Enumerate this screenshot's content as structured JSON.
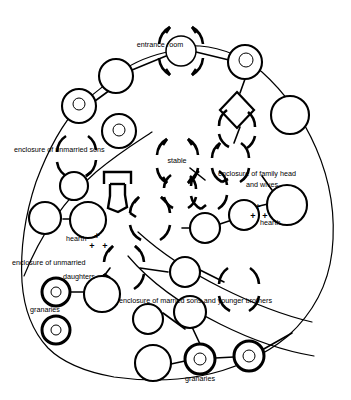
{
  "figure": {
    "type": "architectural-plan-diagram",
    "background_color": "#ffffff",
    "ink_color": "#000000"
  },
  "labels": {
    "entrance_room": "entrance room",
    "enclosure_unmarried_sons": "enclosure of unmarried sons",
    "stable": "stable",
    "enclosure_family_head": "enclosure of family head",
    "enclosure_family_head_2": "and wives",
    "hearth_right": "hearth",
    "hearth_left": "hearth",
    "enclosure_unmarried_daughters_1": "enclosure of unmarried",
    "enclosure_unmarried_daughters_2": "daughters",
    "granaries_left": "granaries",
    "enclosure_married_sons": "enclosure of married sons and younger brothers",
    "granaries_bottom": "granaries"
  },
  "hearth_marks": {
    "left": "+ + +",
    "right": "+ + +"
  },
  "structures": {
    "plain_huts": [
      {
        "id": "hut-top-left",
        "cx": 116,
        "cy": 76,
        "r": 17
      },
      {
        "id": "hut-ul-a",
        "cx": 74,
        "cy": 186,
        "r": 14
      },
      {
        "id": "hut-ul-b",
        "cx": 45,
        "cy": 218,
        "r": 16
      },
      {
        "id": "hut-ul-c",
        "cx": 88,
        "cy": 220,
        "r": 18
      },
      {
        "id": "hut-right-a",
        "cx": 290,
        "cy": 115,
        "r": 19
      },
      {
        "id": "hut-right-b",
        "cx": 287,
        "cy": 205,
        "r": 20
      },
      {
        "id": "hut-mid-a",
        "cx": 205,
        "cy": 228,
        "r": 15
      },
      {
        "id": "hut-mid-b",
        "cx": 244,
        "cy": 215,
        "r": 15
      },
      {
        "id": "hut-mid-c",
        "cx": 185,
        "cy": 272,
        "r": 15
      },
      {
        "id": "hut-left-d",
        "cx": 102,
        "cy": 294,
        "r": 18
      },
      {
        "id": "hut-bot-a",
        "cx": 148,
        "cy": 319,
        "r": 15
      },
      {
        "id": "hut-bot-b",
        "cx": 190,
        "cy": 312,
        "r": 16
      },
      {
        "id": "hut-bot-c",
        "cx": 153,
        "cy": 363,
        "r": 18
      }
    ],
    "ringed_huts": [
      {
        "id": "ring-ul-1",
        "cx": 79,
        "cy": 106,
        "r": 17,
        "ri": 6
      },
      {
        "id": "ring-ul-2",
        "cx": 119,
        "cy": 131,
        "r": 17,
        "ri": 6
      },
      {
        "id": "ring-tr-1",
        "cx": 245,
        "cy": 62,
        "r": 17,
        "ri": 7
      }
    ],
    "granaries": [
      {
        "id": "gran-left-1",
        "cx": 56,
        "cy": 292,
        "r": 14,
        "ri": 5
      },
      {
        "id": "gran-left-2",
        "cx": 56,
        "cy": 330,
        "r": 14,
        "ri": 5
      },
      {
        "id": "gran-bot-1",
        "cx": 200,
        "cy": 359,
        "r": 15,
        "ri": 6
      },
      {
        "id": "gran-bot-2",
        "cx": 249,
        "cy": 356,
        "r": 15,
        "ri": 6
      }
    ],
    "arc_rooms": [
      {
        "id": "entrance-room",
        "cx": 181,
        "cy": 51,
        "r": 15,
        "label": "entrance room"
      },
      {
        "id": "stable-room",
        "cx": 177,
        "cy": 161,
        "r": 14,
        "label": "stable"
      },
      {
        "id": "family-head",
        "cx": 230,
        "cy": 162,
        "r": 14
      },
      {
        "id": "arc-left-1",
        "cx": 76,
        "cy": 156,
        "r": 15
      },
      {
        "id": "arc-mid-1",
        "cx": 150,
        "cy": 219,
        "r": 16
      },
      {
        "id": "arc-mid-2",
        "cx": 124,
        "cy": 268,
        "r": 16
      },
      {
        "id": "arc-mid-3",
        "cx": 209,
        "cy": 190,
        "r": 15
      },
      {
        "id": "arc-right-1",
        "cx": 237,
        "cy": 127,
        "r": 15
      },
      {
        "id": "arc-right-2",
        "cx": 239,
        "cy": 289,
        "r": 16
      },
      {
        "id": "arc-bot-1",
        "cx": 180,
        "cy": 192,
        "r": 13
      }
    ],
    "special": {
      "diamond": {
        "id": "diamond-room",
        "cx": 237,
        "cy": 110,
        "w": 27,
        "h": 34
      },
      "bracket": {
        "id": "bracket-structure",
        "x": 104,
        "y": 170
      }
    }
  }
}
